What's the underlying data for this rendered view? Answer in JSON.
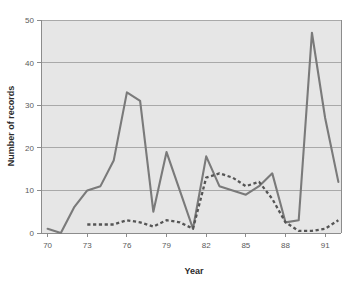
{
  "chart_data": {
    "type": "line",
    "title": "",
    "xlabel": "Year",
    "ylabel": "Number of records",
    "xlim": [
      69.5,
      92.2
    ],
    "ylim": [
      0,
      50
    ],
    "xticks": [
      70,
      73,
      76,
      79,
      82,
      85,
      88,
      91
    ],
    "xtick_labels": [
      "70",
      "73",
      "76",
      "79",
      "82",
      "85",
      "88",
      "91"
    ],
    "yticks": [
      0,
      10,
      20,
      30,
      40,
      50
    ],
    "ytick_labels": [
      "0",
      "10",
      "20",
      "30",
      "40",
      "50"
    ],
    "grid": true,
    "grid_axis": "y",
    "legend": "none",
    "plot_background": "#e6e6e6",
    "figure_background": "#ffffff",
    "x": [
      70,
      71,
      72,
      73,
      74,
      75,
      76,
      77,
      78,
      79,
      80,
      81,
      82,
      83,
      84,
      85,
      86,
      87,
      88,
      89,
      90,
      91,
      92
    ],
    "series": [
      {
        "name": "solid-series",
        "style": "solid",
        "color": "#7a7a7a",
        "x": [
          70,
          71,
          72,
          73,
          74,
          75,
          76,
          77,
          78,
          79,
          80,
          81,
          82,
          83,
          84,
          85,
          86,
          87,
          88,
          89,
          90,
          91,
          92
        ],
        "values": [
          1,
          0,
          6,
          10,
          11,
          17,
          33,
          31,
          5,
          19,
          10,
          1,
          18,
          11,
          10,
          9,
          11,
          14,
          2.5,
          3,
          47,
          27,
          12
        ]
      },
      {
        "name": "dotted-series",
        "style": "dotted",
        "color": "#555555",
        "x": [
          73,
          74,
          75,
          76,
          77,
          78,
          79,
          80,
          81,
          82,
          83,
          84,
          85,
          86,
          87,
          88,
          89,
          90,
          91,
          92
        ],
        "values": [
          2,
          2,
          2,
          3,
          2.5,
          1.5,
          3,
          2.5,
          1,
          13,
          14,
          13,
          11,
          12,
          8,
          2.5,
          0.5,
          0.5,
          1,
          3
        ]
      }
    ]
  }
}
